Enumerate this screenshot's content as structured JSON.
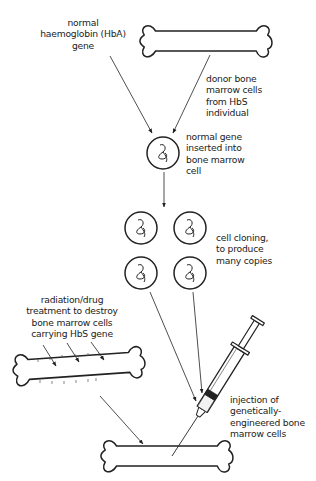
{
  "diagram": {
    "type": "flow-diagram",
    "labels": {
      "normal_gene": "normal\nhaemoglobin (HbA)\ngene",
      "donor_cells": "donor bone\nmarrow cells\nfrom HbS\nindividual",
      "insertion": "normal gene\ninserted into\nbone marrow\ncell",
      "cloning": "cell cloning,\nto produce\nmany copies",
      "radiation": "radiation/drug\ntreatment to destroy\nbone marrow cells\ncarrying HbS gene",
      "injection": "injection of\ngenetically-\nengineered bone\nmarrow cells"
    },
    "nodes": [
      {
        "id": "donor-bone",
        "kind": "bone"
      },
      {
        "id": "engineered-cell",
        "kind": "cell"
      },
      {
        "id": "cloned-cell-1",
        "kind": "cell"
      },
      {
        "id": "cloned-cell-2",
        "kind": "cell"
      },
      {
        "id": "cloned-cell-3",
        "kind": "cell"
      },
      {
        "id": "cloned-cell-4",
        "kind": "cell"
      },
      {
        "id": "treated-bone",
        "kind": "bone"
      },
      {
        "id": "syringe",
        "kind": "syringe"
      },
      {
        "id": "recipient-bone",
        "kind": "bone"
      }
    ],
    "line_color": "#222222"
  }
}
